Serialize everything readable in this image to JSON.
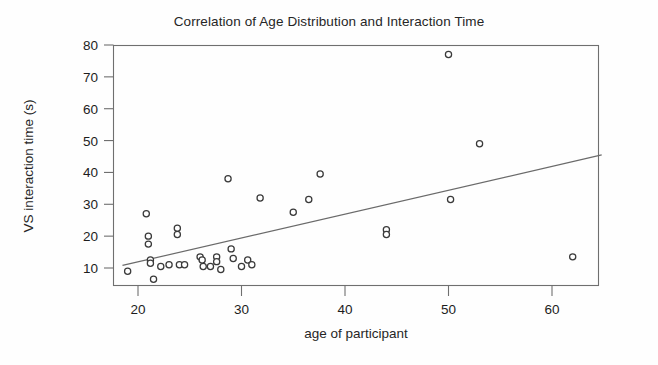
{
  "figure": {
    "title": "Correlation of Age Distribution and Interaction Time",
    "width": 658,
    "height": 365,
    "background_color": "#ffffff",
    "point_color": "#3a3a3a",
    "line_color": "#6a6a6a",
    "frame_color": "#6f6f6f"
  },
  "chart_data": {
    "type": "scatter",
    "title": "Correlation of Age Distribution and Interaction Time",
    "xlabel": "age of participant",
    "ylabel": "VS interaction time (s)",
    "xlim": [
      18,
      65
    ],
    "ylim": [
      5,
      81
    ],
    "xticks": [
      20,
      30,
      40,
      50,
      60
    ],
    "yticks": [
      10,
      20,
      30,
      40,
      50,
      60,
      70,
      80
    ],
    "grid": false,
    "legend": "none",
    "marker": "open-circle",
    "series": [
      {
        "name": "participants",
        "points": [
          [
            19.0,
            9.0
          ],
          [
            20.8,
            27.0
          ],
          [
            21.0,
            20.0
          ],
          [
            21.0,
            17.5
          ],
          [
            21.2,
            12.5
          ],
          [
            21.2,
            11.5
          ],
          [
            21.5,
            6.5
          ],
          [
            22.2,
            10.5
          ],
          [
            23.0,
            11.0
          ],
          [
            23.8,
            22.5
          ],
          [
            23.8,
            20.5
          ],
          [
            24.0,
            11.0
          ],
          [
            24.5,
            11.0
          ],
          [
            26.0,
            13.5
          ],
          [
            26.2,
            12.5
          ],
          [
            26.3,
            10.5
          ],
          [
            27.0,
            10.5
          ],
          [
            27.6,
            13.5
          ],
          [
            27.6,
            12.0
          ],
          [
            28.0,
            9.5
          ],
          [
            28.7,
            38.0
          ],
          [
            29.0,
            16.0
          ],
          [
            29.2,
            13.0
          ],
          [
            30.0,
            10.5
          ],
          [
            30.6,
            12.5
          ],
          [
            31.0,
            11.0
          ],
          [
            31.8,
            32.0
          ],
          [
            35.0,
            27.5
          ],
          [
            36.5,
            31.5
          ],
          [
            37.6,
            39.5
          ],
          [
            44.0,
            22.0
          ],
          [
            44.0,
            20.5
          ],
          [
            50.0,
            77.0
          ],
          [
            50.2,
            31.5
          ],
          [
            53.0,
            49.0
          ],
          [
            62.0,
            13.5
          ]
        ]
      }
    ],
    "trendline": {
      "type": "linear-fit",
      "x_start": 18.5,
      "y_start": 10.8,
      "x_end": 64.8,
      "y_end": 45.5
    }
  }
}
